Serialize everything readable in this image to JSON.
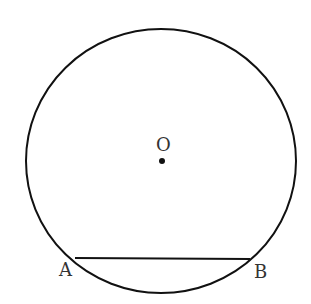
{
  "diagram": {
    "type": "circle-with-chord",
    "center": {
      "label": "O",
      "x": 162,
      "y": 161
    },
    "circle": {
      "cx": 161,
      "cy": 161,
      "rx": 135,
      "ry": 132,
      "stroke": "#111111"
    },
    "chord": {
      "from": {
        "label": "A",
        "x": 75,
        "y": 258
      },
      "to": {
        "label": "B",
        "x": 250,
        "y": 259
      }
    },
    "labels": {
      "center": "O",
      "point_a": "A",
      "point_b": "B"
    }
  }
}
